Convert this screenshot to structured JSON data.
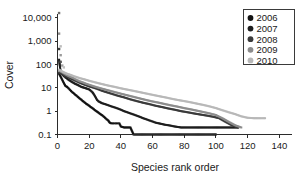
{
  "chart_data": {
    "type": "line",
    "title": "",
    "xlabel": "Species rank order",
    "ylabel": "Cover",
    "yscale": "log",
    "xlim": [
      0,
      148
    ],
    "ylim": [
      0.1,
      20000
    ],
    "grid": false,
    "legend_position": "top-right",
    "x_ticks": [
      0,
      20,
      40,
      60,
      80,
      100,
      120,
      140
    ],
    "x_tick_labels": [
      "0",
      "20",
      "40",
      "60",
      "80",
      "100",
      "120",
      "140"
    ],
    "y_ticks": [
      0.1,
      1,
      10,
      100,
      1000,
      10000
    ],
    "y_tick_labels": [
      "0.1",
      "1",
      "10",
      "100",
      "1,000",
      "10,000"
    ],
    "series": [
      {
        "name": "2006",
        "color": "#121212",
        "x": [
          1,
          2,
          3,
          4,
          5,
          6,
          7,
          8,
          9,
          10,
          11,
          12,
          13,
          14,
          15,
          16,
          17,
          18,
          19,
          20,
          21,
          22,
          23,
          24,
          25,
          26,
          27,
          28,
          29,
          30,
          31,
          32,
          33,
          34,
          35,
          36,
          37,
          38,
          39,
          40,
          42,
          44,
          46,
          48,
          52,
          56,
          60,
          64,
          68,
          72,
          76,
          80,
          84,
          88,
          92,
          96,
          100
        ],
        "values": [
          40,
          30,
          22,
          16,
          12,
          11,
          9.5,
          8,
          6.8,
          6.0,
          5.2,
          4.6,
          4.0,
          3.5,
          3.1,
          2.7,
          2.4,
          2.1,
          1.9,
          1.7,
          1.5,
          1.35,
          1.2,
          1.05,
          0.95,
          0.85,
          0.75,
          0.68,
          0.6,
          0.52,
          0.45,
          0.4,
          0.32,
          0.3,
          0.3,
          0.3,
          0.3,
          0.3,
          0.3,
          0.22,
          0.2,
          0.2,
          0.2,
          0.1,
          0.1,
          0.1,
          0.1,
          0.1,
          0.1,
          0.1,
          0.1,
          0.1,
          0.1,
          0.1,
          0.1,
          0.1,
          0.1
        ]
      },
      {
        "name": "2007",
        "color": "#1d1d1d",
        "x": [
          1,
          2,
          3,
          4,
          5,
          6,
          7,
          8,
          9,
          10,
          11,
          12,
          13,
          14,
          15,
          16,
          17,
          18,
          19,
          20,
          21,
          22,
          23,
          24,
          25,
          26,
          27,
          28,
          30,
          32,
          34,
          36,
          38,
          40,
          42,
          44,
          46,
          48,
          50,
          52,
          54,
          56,
          58,
          60,
          62,
          64,
          66,
          68,
          70,
          74,
          78,
          82,
          86,
          90,
          94,
          98,
          102,
          106,
          110,
          114
        ],
        "values": [
          160,
          45,
          38,
          32,
          28,
          25,
          22,
          20,
          18,
          16.5,
          15,
          14,
          13,
          12,
          11,
          10.5,
          10,
          9.5,
          9,
          8.5,
          7.5,
          6.5,
          5.2,
          4.0,
          3.0,
          2.6,
          2.4,
          2.2,
          2.0,
          1.8,
          1.6,
          1.45,
          1.3,
          1.15,
          1.0,
          0.9,
          0.8,
          0.72,
          0.64,
          0.57,
          0.5,
          0.45,
          0.4,
          0.36,
          0.32,
          0.3,
          0.28,
          0.26,
          0.25,
          0.22,
          0.2,
          0.2,
          0.2,
          0.2,
          0.2,
          0.2,
          0.2,
          0.2,
          0.2,
          0.2
        ]
      },
      {
        "name": "2008",
        "color": "#3a3a3a",
        "x": [
          1,
          2,
          3,
          4,
          5,
          6,
          7,
          8,
          9,
          10,
          12,
          14,
          16,
          18,
          20,
          22,
          24,
          26,
          28,
          30,
          34,
          38,
          42,
          46,
          50,
          54,
          58,
          62,
          66,
          70,
          74,
          78,
          82,
          86,
          90,
          94,
          98,
          102,
          106,
          110,
          114
        ],
        "values": [
          45,
          42,
          38,
          35,
          32,
          30,
          28,
          26,
          24,
          22,
          19,
          16.5,
          14.5,
          13,
          11.5,
          10.5,
          9.5,
          8.5,
          7.5,
          6.8,
          5.6,
          4.6,
          3.9,
          3.2,
          2.7,
          2.3,
          2.0,
          1.7,
          1.5,
          1.3,
          1.15,
          1.0,
          0.9,
          0.8,
          0.72,
          0.65,
          0.58,
          0.5,
          0.35,
          0.25,
          0.2
        ]
      },
      {
        "name": "2009",
        "color": "#8c8c8c",
        "x": [
          1,
          2,
          3,
          4,
          5,
          6,
          7,
          8,
          9,
          10,
          12,
          14,
          16,
          18,
          20,
          24,
          28,
          32,
          36,
          40,
          44,
          48,
          52,
          56,
          60,
          64,
          68,
          72,
          76,
          80,
          84,
          88,
          92,
          96,
          100,
          104,
          108,
          112,
          116
        ],
        "values": [
          55,
          50,
          46,
          42,
          38,
          35,
          32,
          30,
          28,
          26,
          22,
          19,
          17,
          15,
          13.5,
          11,
          9.2,
          7.8,
          6.6,
          5.6,
          4.8,
          4.1,
          3.5,
          3.0,
          2.6,
          2.3,
          2.0,
          1.75,
          1.55,
          1.35,
          1.2,
          1.05,
          0.92,
          0.8,
          0.68,
          0.5,
          0.35,
          0.25,
          0.2
        ]
      },
      {
        "name": "2010",
        "color": "#b8b8b8",
        "x": [
          1,
          2,
          3,
          4,
          5,
          6,
          7,
          8,
          9,
          10,
          12,
          14,
          16,
          18,
          20,
          24,
          28,
          32,
          36,
          40,
          44,
          48,
          52,
          56,
          60,
          64,
          68,
          72,
          76,
          80,
          84,
          88,
          92,
          96,
          100,
          104,
          108,
          112,
          116,
          120,
          124,
          128,
          131
        ],
        "values": [
          60,
          55,
          50,
          46,
          43,
          40,
          38,
          36,
          34,
          32,
          29,
          26,
          24,
          22,
          20,
          17,
          14.5,
          12.5,
          11,
          9.5,
          8.4,
          7.4,
          6.5,
          5.7,
          5.0,
          4.4,
          3.9,
          3.4,
          3.0,
          2.7,
          2.4,
          2.1,
          1.85,
          1.6,
          1.35,
          1.1,
          0.9,
          0.75,
          0.6,
          0.52,
          0.5,
          0.5,
          0.5
        ]
      }
    ],
    "outliers": [
      {
        "x": 1,
        "y": 16000,
        "color": "#6e6e6e"
      },
      {
        "x": 1,
        "y": 2100,
        "color": "#8c8c8c"
      },
      {
        "x": 1,
        "y": 460,
        "color": "#3a3a3a"
      },
      {
        "x": 2,
        "y": 600,
        "color": "#bdbdbd"
      },
      {
        "x": 2,
        "y": 250,
        "color": "#9a9a9a"
      },
      {
        "x": 2,
        "y": 130,
        "color": "#555555"
      },
      {
        "x": 3,
        "y": 90,
        "color": "#a0a0a0"
      },
      {
        "x": 4,
        "y": 75,
        "color": "#c0c0c0"
      }
    ]
  },
  "legend": {
    "entries": [
      {
        "label": "2006",
        "color": "#121212"
      },
      {
        "label": "2007",
        "color": "#1d1d1d"
      },
      {
        "label": "2008",
        "color": "#3a3a3a"
      },
      {
        "label": "2009",
        "color": "#8c8c8c"
      },
      {
        "label": "2010",
        "color": "#b8b8b8"
      }
    ]
  }
}
